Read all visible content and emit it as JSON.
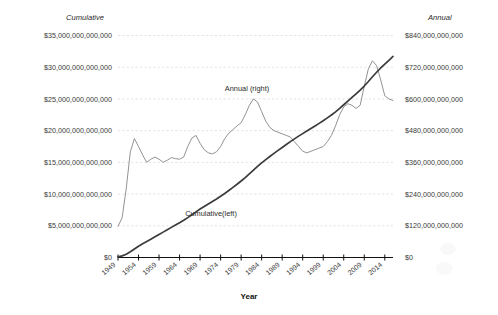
{
  "chart_data": {
    "type": "line",
    "title": "",
    "xlabel": "Year",
    "left_axis_title": "Cumulative",
    "right_axis_title": "Annual",
    "grid": true,
    "legend": "inline-annotations",
    "x": [
      1949,
      1950,
      1951,
      1952,
      1953,
      1954,
      1955,
      1956,
      1957,
      1958,
      1959,
      1960,
      1961,
      1962,
      1963,
      1964,
      1965,
      1966,
      1967,
      1968,
      1969,
      1970,
      1971,
      1972,
      1973,
      1974,
      1975,
      1976,
      1977,
      1978,
      1979,
      1980,
      1981,
      1982,
      1983,
      1984,
      1985,
      1986,
      1987,
      1988,
      1989,
      1990,
      1991,
      1992,
      1993,
      1994,
      1995,
      1996,
      1997,
      1998,
      1999,
      2000,
      2001,
      2002,
      2003,
      2004,
      2005,
      2006,
      2007,
      2008,
      2009,
      2010,
      2011,
      2012,
      2013,
      2014,
      2015,
      2016
    ],
    "xlim": [
      1949,
      2016
    ],
    "xticks": [
      "1949",
      "1954",
      "1959",
      "1964",
      "1969",
      "1974",
      "1979",
      "1984",
      "1989",
      "1994",
      "1999",
      "2004",
      "2009",
      "2014"
    ],
    "left_ylim": [
      0,
      35000000000000
    ],
    "left_yticks": [
      "$0",
      "$5,000,000,000,000",
      "$10,000,000,000,000",
      "$15,000,000,000,000",
      "$20,000,000,000,000",
      "$25,000,000,000,000",
      "$30,000,000,000,000",
      "$35,000,000,000,000"
    ],
    "right_ylim": [
      0,
      840000000000
    ],
    "right_yticks": [
      "$0",
      "$120,000,000,000",
      "$240,000,000,000",
      "$360,000,000,000",
      "$480,000,000,000",
      "$600,000,000,000",
      "$720,000,000,000",
      "$840,000,000,000"
    ],
    "series": [
      {
        "name": "Annual (right)",
        "axis": "right",
        "label_text": "Annual (right)",
        "color": "#8c8c8c",
        "values": [
          118000000000,
          150000000000,
          260000000000,
          400000000000,
          450000000000,
          420000000000,
          388000000000,
          360000000000,
          372000000000,
          380000000000,
          372000000000,
          360000000000,
          368000000000,
          378000000000,
          374000000000,
          372000000000,
          380000000000,
          420000000000,
          452000000000,
          462000000000,
          432000000000,
          408000000000,
          396000000000,
          392000000000,
          400000000000,
          420000000000,
          450000000000,
          470000000000,
          484000000000,
          498000000000,
          510000000000,
          540000000000,
          576000000000,
          600000000000,
          588000000000,
          552000000000,
          516000000000,
          492000000000,
          480000000000,
          474000000000,
          468000000000,
          462000000000,
          456000000000,
          438000000000,
          420000000000,
          402000000000,
          396000000000,
          402000000000,
          408000000000,
          414000000000,
          420000000000,
          438000000000,
          462000000000,
          498000000000,
          540000000000,
          570000000000,
          582000000000,
          576000000000,
          564000000000,
          576000000000,
          648000000000,
          714000000000,
          744000000000,
          726000000000,
          672000000000,
          612000000000,
          600000000000,
          594000000000
        ]
      },
      {
        "name": "Cumulative(left)",
        "axis": "left",
        "label_text": "Cumulative(left)",
        "color": "#3b3b3b",
        "values": [
          100000000000,
          250000000000,
          500000000000,
          900000000000,
          1350000000000,
          1780000000000,
          2160000000000,
          2520000000000,
          2890000000000,
          3270000000000,
          3640000000000,
          4000000000000,
          4370000000000,
          4750000000000,
          5120000000000,
          5490000000000,
          5870000000000,
          6290000000000,
          6740000000000,
          7200000000000,
          7640000000000,
          8040000000000,
          8440000000000,
          8830000000000,
          9230000000000,
          9650000000000,
          10100000000000,
          10570000000000,
          11050000000000,
          11550000000000,
          12060000000000,
          12600000000000,
          13180000000000,
          13780000000000,
          14370000000000,
          14920000000000,
          15440000000000,
          15930000000000,
          16410000000000,
          16880000000000,
          17350000000000,
          17810000000000,
          18270000000000,
          18710000000000,
          19130000000000,
          19530000000000,
          19930000000000,
          20330000000000,
          20740000000000,
          21150000000000,
          21570000000000,
          22010000000000,
          22470000000000,
          22970000000000,
          23510000000000,
          24080000000000,
          24660000000000,
          25240000000000,
          25800000000000,
          26380000000000,
          27030000000000,
          27740000000000,
          28490000000000,
          29210000000000,
          29880000000000,
          30490000000000,
          31090000000000,
          31690000000000
        ]
      }
    ],
    "annotations": [
      {
        "text": "Annual (right)",
        "x_px": 247,
        "y_px": 89
      },
      {
        "text": "Cumulative(left)",
        "x_px": 211,
        "y_px": 213
      }
    ]
  },
  "axis": {
    "left_title": "Cumulative",
    "right_title": "Annual",
    "x_title": "Year"
  }
}
